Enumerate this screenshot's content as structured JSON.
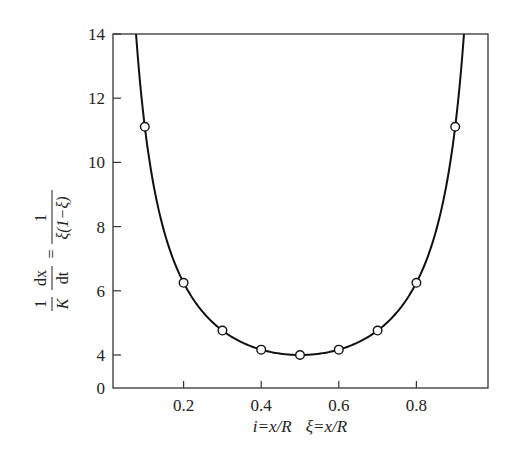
{
  "chart_data": {
    "type": "line",
    "title": "",
    "xlabel": "i=x/R   ξ=x/R",
    "ylabel": "(1/K)(dx/dt) = 1/(ξ(1−ξ))",
    "ylabel_parts": {
      "left_num": "1",
      "left_den": "K",
      "mid_num": "dx",
      "mid_den": "dt",
      "eq": "=",
      "right_num": "1",
      "right_den": "ξ(1−ξ)"
    },
    "xlim": [
      0,
      1
    ],
    "ylim": [
      0,
      14
    ],
    "y_axis_broken": true,
    "x_ticks": [
      0.2,
      0.4,
      0.6,
      0.8
    ],
    "x_tick_labels": [
      "0.2",
      "0.4",
      "0.6",
      "0.8"
    ],
    "y_ticks": [
      0,
      4,
      6,
      8,
      10,
      12,
      14
    ],
    "y_tick_labels": [
      "0",
      "4",
      "6",
      "8",
      "10",
      "12",
      "14"
    ],
    "grid": false,
    "legend": null,
    "series": [
      {
        "name": "curve 1/(ξ(1−ξ))",
        "style": "solid-line",
        "function": "1/(x*(1-x))"
      },
      {
        "name": "points",
        "style": "open-circle-markers",
        "x": [
          0.1,
          0.2,
          0.3,
          0.4,
          0.5,
          0.6,
          0.7,
          0.8,
          0.9
        ],
        "y": [
          11.0,
          6.1,
          4.7,
          4.15,
          3.95,
          4.15,
          4.7,
          6.1,
          11.0
        ]
      }
    ]
  },
  "labels": {
    "xlabel_i": "i",
    "xlabel_eq1": "=x/R",
    "xlabel_xi": "ξ",
    "xlabel_eq2": "=x/R"
  }
}
